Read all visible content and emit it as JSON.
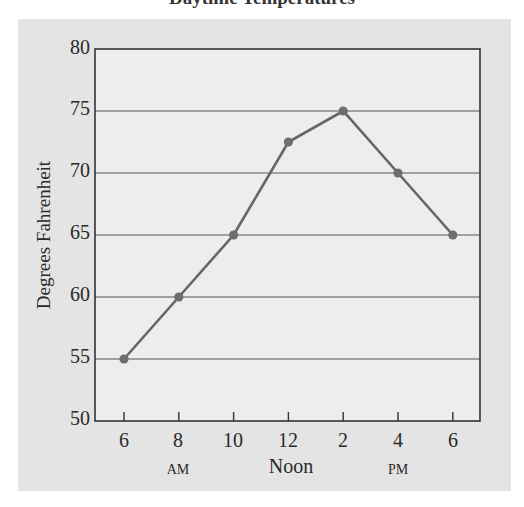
{
  "chart_data": {
    "type": "line",
    "title": "Daytime Temperatures",
    "xlabel": "",
    "ylabel": "Degrees Fahrenheit",
    "x": [
      "6",
      "8",
      "10",
      "12",
      "2",
      "4",
      "6"
    ],
    "x_period_labels": [
      {
        "label": "AM",
        "under_index": 1
      },
      {
        "label": "Noon",
        "under_index": 3
      },
      {
        "label": "PM",
        "under_index": 5
      }
    ],
    "series": [
      {
        "name": "Temperature",
        "values": [
          55,
          60,
          65,
          72.5,
          75,
          70,
          65
        ]
      }
    ],
    "ylim": [
      50,
      80
    ],
    "yticks": [
      50,
      55,
      60,
      65,
      70,
      75,
      80
    ],
    "grid": {
      "horizontal": true,
      "vertical": false
    },
    "legend": null
  },
  "labels": {
    "title": "Daytime Temperatures",
    "ylabel": "Degrees Fahrenheit",
    "yticks": [
      "80",
      "75",
      "70",
      "65",
      "60",
      "55",
      "50"
    ],
    "xticks": [
      "6",
      "8",
      "10",
      "12",
      "2",
      "4",
      "6"
    ],
    "am": "AM",
    "noon": "Noon",
    "pm": "PM"
  },
  "colors": {
    "panel": "#e4e4e4",
    "plot_bg": "#ededed",
    "line": "#666666",
    "marker": "#6e6e6e",
    "grid": "#555555",
    "frame": "#333333"
  }
}
